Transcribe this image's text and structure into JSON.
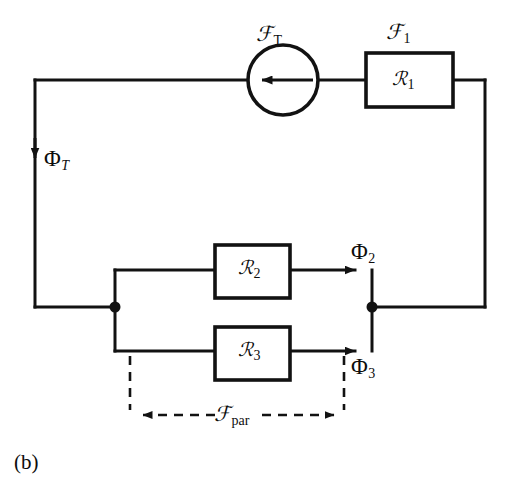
{
  "figure": {
    "caption": "(b)",
    "kind": "magnetic-equivalent-circuit",
    "colors": {
      "line": "#121212",
      "background": "#ffffff",
      "text": "#0d0d0d"
    }
  },
  "source": {
    "symbol": "circle-with-arrow",
    "label_script": "ℱ",
    "label_subscript": "T",
    "label_full": "ℱT",
    "arrow_direction": "left"
  },
  "reluctances": [
    {
      "id": "R1",
      "symbol": "ℛ",
      "subscript": "1",
      "label_full": "ℛ1",
      "mmf_label_script": "ℱ",
      "mmf_label_subscript": "1",
      "mmf_label_full": "ℱ1"
    },
    {
      "id": "R2",
      "symbol": "ℛ",
      "subscript": "2",
      "label_full": "ℛ2",
      "flux_label_symbol": "Φ",
      "flux_label_subscript": "2",
      "flux_label_full": "Φ2"
    },
    {
      "id": "R3",
      "symbol": "ℛ",
      "subscript": "3",
      "label_full": "ℛ3",
      "flux_label_symbol": "Φ",
      "flux_label_subscript": "3",
      "flux_label_full": "Φ3"
    }
  ],
  "fluxes": [
    {
      "id": "total",
      "symbol": "Φ",
      "subscript": "T",
      "label_full": "ΦT",
      "direction": "down"
    },
    {
      "id": "branch2",
      "symbol": "Φ",
      "subscript": "2",
      "label_full": "Φ2",
      "direction": "right"
    },
    {
      "id": "branch3",
      "symbol": "Φ",
      "subscript": "3",
      "label_full": "Φ3",
      "direction": "right"
    }
  ],
  "annotation": {
    "label_script": "ℱ",
    "label_subscript": "par",
    "label_full": "ℱpar",
    "style": "dashed-double-arrow"
  }
}
